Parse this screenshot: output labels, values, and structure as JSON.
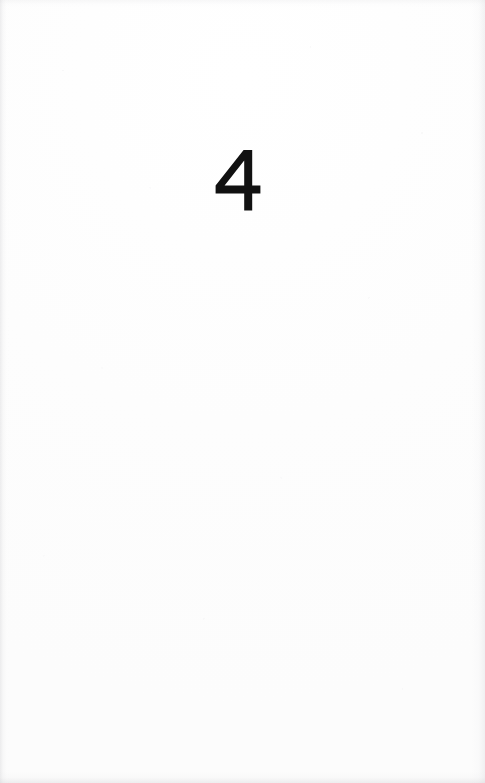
{
  "page": {
    "kind": "scanned-book-page",
    "background_color": "#fefefe",
    "ink_color": "#111111",
    "width": 485,
    "height": 783
  },
  "content": {
    "chapter_number": "4",
    "chapter_number_position": "upper-third-centered"
  }
}
